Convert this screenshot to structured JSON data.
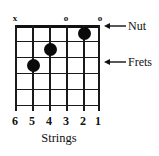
{
  "diagram": {
    "strings_caption": "Strings",
    "string_numbers": [
      "6",
      "5",
      "4",
      "3",
      "2",
      "1"
    ],
    "top_markers": [
      {
        "string": 6,
        "symbol": "x"
      },
      {
        "string": 3,
        "symbol": "o"
      },
      {
        "string": 1,
        "symbol": "o"
      }
    ],
    "callouts": [
      {
        "label": "Nut",
        "target": "nut-line"
      },
      {
        "label": "Frets",
        "target": "fret-line"
      }
    ],
    "grid": {
      "strings": 6,
      "frets": 5
    },
    "finger_dots": [
      {
        "string": 2,
        "fret": 1
      },
      {
        "string": 4,
        "fret": 2
      },
      {
        "string": 5,
        "fret": 3
      }
    ],
    "colors": {
      "ink": "#111111",
      "dot": "#0a0a0a",
      "background": "#ffffff"
    }
  }
}
